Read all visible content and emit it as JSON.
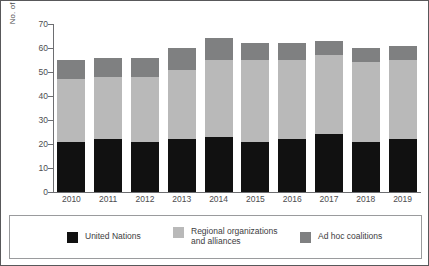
{
  "chart_data": {
    "type": "bar",
    "stacked": true,
    "title": "",
    "xlabel": "",
    "ylabel": "No. of operations",
    "ylim": [
      0,
      70
    ],
    "ytick_step": 10,
    "yticks": [
      0,
      10,
      20,
      30,
      40,
      50,
      60,
      70
    ],
    "grid": false,
    "legend_position": "bottom",
    "categories": [
      "2010",
      "2011",
      "2012",
      "2013",
      "2014",
      "2015",
      "2016",
      "2017",
      "2018",
      "2019"
    ],
    "series": [
      {
        "name": "United Nations",
        "color": "#111111",
        "values": [
          21,
          22,
          21,
          22,
          23,
          21,
          22,
          24,
          21,
          22
        ]
      },
      {
        "name": "Regional organizations\nand alliances",
        "color": "#b9b9b9",
        "values": [
          26,
          26,
          27,
          29,
          32,
          34,
          33,
          33,
          33,
          33
        ]
      },
      {
        "name": "Ad hoc coalitions",
        "color": "#7f8081",
        "values": [
          8,
          8,
          8,
          9,
          9,
          7,
          7,
          6,
          6,
          6
        ]
      }
    ],
    "totals": [
      55,
      56,
      56,
      60,
      64,
      62,
      62,
      63,
      60,
      61
    ]
  },
  "legend": {
    "items": [
      {
        "label": "United Nations"
      },
      {
        "label": "Regional organizations\nand alliances"
      },
      {
        "label": "Ad hoc coalitions"
      }
    ]
  }
}
